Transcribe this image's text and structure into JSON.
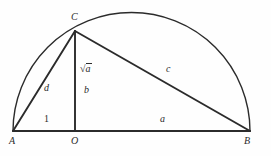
{
  "figure": {
    "background_color": "#fefefe",
    "stroke_color": "#2b2b2b",
    "label_color": "#2b2b2b"
  },
  "points": {
    "a": {
      "label": "A",
      "x": 13,
      "y": 131,
      "label_x": 9,
      "label_y": 136
    },
    "o": {
      "label": "O",
      "x": 75,
      "y": 131,
      "label_x": 71,
      "label_y": 136
    },
    "b": {
      "label": "B",
      "x": 250,
      "y": 131,
      "label_x": 246,
      "label_y": 136
    },
    "c": {
      "label": "C",
      "x": 75,
      "y": 31,
      "label_x": 71,
      "label_y": 12
    }
  },
  "segment_labels": {
    "ao": {
      "text": "1",
      "x": 44,
      "y": 114
    },
    "ob": {
      "text": "a",
      "x": 160,
      "y": 114
    },
    "ac": {
      "text": "d",
      "x": 44,
      "y": 83
    },
    "cb": {
      "text": "c",
      "x": 166,
      "y": 64
    },
    "co_upper": {
      "radical": "√",
      "argument": "a",
      "x": 80,
      "y": 68
    },
    "co_lower": {
      "text": "b",
      "x": 85,
      "y": 89
    }
  },
  "arc": {
    "center_x": 131.5,
    "center_y": 131,
    "radius": 118.5,
    "apex_x": 131.5,
    "apex_y": 12.5
  },
  "geometry_paths": {
    "baseline": "M 13 131 L 250 131",
    "hypotenuse_left": "M 13 131 L 75 31",
    "hypotenuse_right": "M 75 31 L 250 131",
    "altitude": "M 75 31 L 75 131",
    "semicircle": "M 13 131 A 118.5 118.5 0 0 1 250 131"
  }
}
